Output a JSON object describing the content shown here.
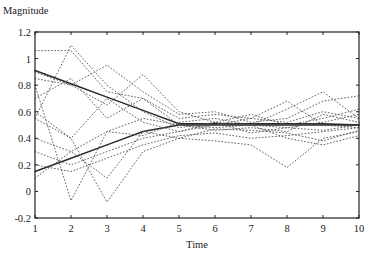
{
  "chart_data": {
    "type": "line",
    "title": "",
    "xlabel": "Time",
    "ylabel": "Magnitude",
    "xlim": [
      1,
      10
    ],
    "ylim": [
      -0.2,
      1.2
    ],
    "grid": false,
    "legend": null,
    "x_ticks": [
      1,
      2,
      3,
      4,
      5,
      6,
      7,
      8,
      9,
      10
    ],
    "y_ticks": [
      -0.2,
      0,
      0.2,
      0.4,
      0.6,
      0.8,
      1,
      1.2
    ],
    "y_tick_labels": [
      "-0.2",
      "0",
      "0.2",
      "0.4",
      "0.6",
      "0.8",
      "1",
      "1.2"
    ],
    "x": [
      1,
      2,
      3,
      4,
      5,
      6,
      7,
      8,
      9,
      10
    ],
    "series": [
      {
        "name": "upper bound (solid)",
        "style": "solid",
        "values": [
          0.91,
          0.81,
          0.71,
          0.61,
          0.51,
          0.51,
          0.51,
          0.51,
          0.51,
          0.5
        ]
      },
      {
        "name": "lower bound (solid)",
        "style": "solid",
        "values": [
          0.15,
          0.25,
          0.35,
          0.45,
          0.5,
          0.5,
          0.5,
          0.5,
          0.5,
          0.5
        ]
      },
      {
        "name": "trace 1",
        "style": "dotted",
        "values": [
          1.06,
          1.06,
          0.75,
          0.7,
          0.55,
          0.58,
          0.55,
          0.52,
          0.6,
          0.55
        ]
      },
      {
        "name": "trace 2",
        "style": "dotted",
        "values": [
          0.55,
          1.1,
          0.8,
          0.6,
          0.48,
          0.52,
          0.5,
          0.48,
          0.52,
          0.58
        ]
      },
      {
        "name": "trace 3",
        "style": "dotted",
        "values": [
          0.85,
          0.8,
          0.95,
          0.75,
          0.58,
          0.6,
          0.52,
          0.55,
          0.68,
          0.72
        ]
      },
      {
        "name": "trace 4",
        "style": "dotted",
        "values": [
          0.9,
          0.8,
          0.65,
          0.88,
          0.6,
          0.52,
          0.58,
          0.5,
          0.55,
          0.62
        ]
      },
      {
        "name": "trace 5",
        "style": "dotted",
        "values": [
          0.7,
          0.85,
          0.55,
          0.7,
          0.5,
          0.48,
          0.5,
          0.62,
          0.75,
          0.55
        ]
      },
      {
        "name": "trace 6",
        "style": "dotted",
        "values": [
          0.55,
          0.4,
          0.7,
          0.52,
          0.45,
          0.5,
          0.55,
          0.68,
          0.5,
          0.48
        ]
      },
      {
        "name": "trace 7",
        "style": "dotted",
        "values": [
          0.4,
          0.3,
          0.45,
          0.55,
          0.5,
          0.46,
          0.48,
          0.45,
          0.58,
          0.52
        ]
      },
      {
        "name": "trace 8",
        "style": "dotted",
        "values": [
          0.3,
          0.2,
          0.3,
          0.4,
          0.45,
          0.52,
          0.44,
          0.48,
          0.46,
          0.5
        ]
      },
      {
        "name": "trace 9",
        "style": "dotted",
        "values": [
          0.2,
          0.15,
          0.25,
          0.35,
          0.42,
          0.44,
          0.4,
          0.42,
          0.45,
          0.48
        ]
      },
      {
        "name": "trace 10",
        "style": "dotted",
        "values": [
          0.8,
          -0.07,
          0.45,
          0.42,
          0.52,
          0.55,
          0.5,
          0.4,
          0.35,
          0.42
        ]
      },
      {
        "name": "trace 11",
        "style": "dotted",
        "values": [
          0.6,
          0.4,
          -0.08,
          0.3,
          0.4,
          0.47,
          0.46,
          0.44,
          0.38,
          0.46
        ]
      },
      {
        "name": "trace 12",
        "style": "dotted",
        "values": [
          0.1,
          0.3,
          0.1,
          0.45,
          0.4,
          0.38,
          0.35,
          0.18,
          0.4,
          0.45
        ]
      }
    ]
  }
}
